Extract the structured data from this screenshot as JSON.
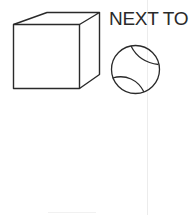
{
  "diagram": {
    "relation_label": "NEXT TO",
    "objects": [
      {
        "name": "cube",
        "shape": "3D cube outline"
      },
      {
        "name": "ball",
        "shape": "tennis ball outline"
      }
    ]
  },
  "colors": {
    "stroke": "#2a2a2a",
    "background": "#ffffff"
  }
}
